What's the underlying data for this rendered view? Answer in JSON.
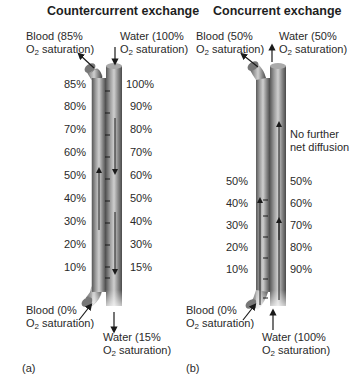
{
  "panels": [
    {
      "id": "a",
      "title": "Countercurrent exchange",
      "panel_label": "(a)",
      "blood_in": {
        "line1": "Blood (0%",
        "line2": "saturation)",
        "o2": "O",
        "o2sub": "2"
      },
      "blood_out": {
        "line1": "Blood (85%",
        "line2": "saturation)",
        "o2": "O",
        "o2sub": "2"
      },
      "water_in": {
        "line1": "Water (100%",
        "line2": "saturation)",
        "o2": "O",
        "o2sub": "2"
      },
      "water_out": {
        "line1": "Water (15%",
        "line2": "saturation)",
        "o2": "O",
        "o2sub": "2"
      },
      "blood_pcts": [
        "85%",
        "80%",
        "70%",
        "60%",
        "50%",
        "40%",
        "30%",
        "20%",
        "10%"
      ],
      "water_pcts": [
        "100%",
        "90%",
        "80%",
        "70%",
        "60%",
        "50%",
        "40%",
        "30%",
        "15%"
      ]
    },
    {
      "id": "b",
      "title": "Concurrent exchange",
      "panel_label": "(b)",
      "blood_in": {
        "line1": "Blood (0%",
        "line2": "saturation)",
        "o2": "O",
        "o2sub": "2"
      },
      "blood_out": {
        "line1": "Blood (50%",
        "line2": "saturation)",
        "o2": "O",
        "o2sub": "2"
      },
      "water_in": {
        "line1": "Water (100%",
        "line2": "saturation)",
        "o2": "O",
        "o2sub": "2"
      },
      "water_out": {
        "line1": "Water (50%",
        "line2": "saturation)",
        "o2": "O",
        "o2sub": "2"
      },
      "note": {
        "line1": "No further",
        "line2": "net diffusion"
      },
      "blood_pcts": [
        "50%",
        "40%",
        "30%",
        "20%",
        "10%"
      ],
      "water_pcts": [
        "50%",
        "60%",
        "70%",
        "80%",
        "90%"
      ]
    }
  ],
  "colors": {
    "tube_dark": "#4a4a4a",
    "tube_mid": "#8a8a8a",
    "tube_light": "#c8c8c8",
    "arrow": "#1a1a1a"
  }
}
